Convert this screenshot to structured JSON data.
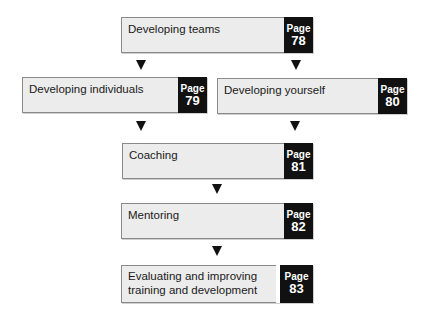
{
  "diagram": {
    "page_word": "Page",
    "nodes": [
      {
        "id": "developing-teams",
        "label": "Developing teams",
        "page": "78"
      },
      {
        "id": "developing-individuals",
        "label": "Developing individuals",
        "page": "79"
      },
      {
        "id": "developing-yourself",
        "label": "Developing yourself",
        "page": "80"
      },
      {
        "id": "coaching",
        "label": "Coaching",
        "page": "81"
      },
      {
        "id": "mentoring",
        "label": "Mentoring",
        "page": "82"
      },
      {
        "id": "evaluating",
        "label": "Evaluating and improving\ntraining and development",
        "page": "83"
      }
    ],
    "edges": [
      {
        "from": "developing-teams",
        "to": "developing-individuals"
      },
      {
        "from": "developing-teams",
        "to": "developing-yourself"
      },
      {
        "from": "developing-individuals",
        "to": "coaching"
      },
      {
        "from": "developing-yourself",
        "to": "coaching"
      },
      {
        "from": "coaching",
        "to": "mentoring"
      },
      {
        "from": "mentoring",
        "to": "evaluating"
      }
    ],
    "colors": {
      "box_fill": "#ececec",
      "page_panel": "#111111",
      "arrow": "#111111"
    }
  }
}
